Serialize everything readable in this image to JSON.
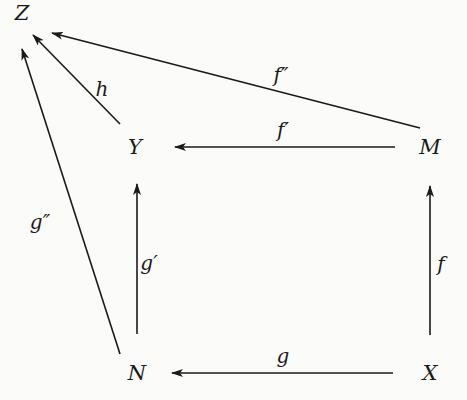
{
  "diagram": {
    "type": "commutative-diagram",
    "nodes": [
      {
        "id": "Z",
        "label": "Z",
        "x": 22,
        "y": 13
      },
      {
        "id": "Y",
        "label": "Y",
        "x": 135,
        "y": 147
      },
      {
        "id": "M",
        "label": "M",
        "x": 430,
        "y": 147
      },
      {
        "id": "N",
        "label": "N",
        "x": 137,
        "y": 373
      },
      {
        "id": "X",
        "label": "X",
        "x": 430,
        "y": 373
      }
    ],
    "edges": [
      {
        "id": "g",
        "from": "X",
        "to": "N",
        "label": "g",
        "x1": 393,
        "y1": 373,
        "x2": 172,
        "y2": 373,
        "lx": 283,
        "ly": 356
      },
      {
        "id": "f",
        "from": "X",
        "to": "M",
        "label": "f",
        "x1": 430,
        "y1": 335,
        "x2": 430,
        "y2": 186,
        "lx": 441,
        "ly": 264
      },
      {
        "id": "g-prime",
        "from": "N",
        "to": "Y",
        "label": "g′",
        "x1": 137,
        "y1": 334,
        "x2": 137,
        "y2": 184,
        "lx": 149,
        "ly": 263
      },
      {
        "id": "f-prime",
        "from": "M",
        "to": "Y",
        "label": "f′",
        "x1": 395,
        "y1": 147,
        "x2": 175,
        "y2": 147,
        "lx": 283,
        "ly": 130
      },
      {
        "id": "f-double-prime",
        "from": "M",
        "to": "Z",
        "label": "f″",
        "x1": 420,
        "y1": 128,
        "x2": 52,
        "y2": 33,
        "lx": 281,
        "ly": 75
      },
      {
        "id": "h",
        "from": "Y",
        "to": "Z",
        "label": "h",
        "x1": 120,
        "y1": 124,
        "x2": 33,
        "y2": 35,
        "lx": 102,
        "ly": 89
      },
      {
        "id": "g-double-prime",
        "from": "N",
        "to": "Z",
        "label": "g″",
        "x1": 120,
        "y1": 354,
        "x2": 22,
        "y2": 49,
        "lx": 40,
        "ly": 222
      }
    ]
  }
}
